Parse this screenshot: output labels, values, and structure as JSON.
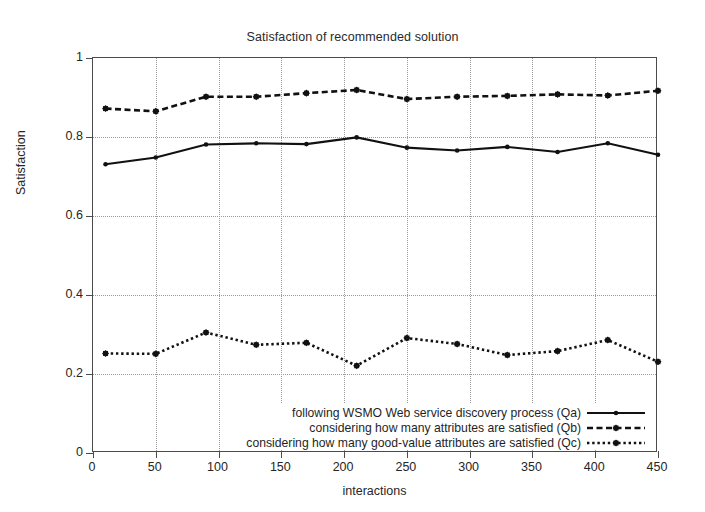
{
  "chart_data": {
    "type": "line",
    "title": "Satisfaction of recommended solution",
    "xlabel": "interactions",
    "ylabel": "Satisfaction",
    "xlim": [
      0,
      450
    ],
    "ylim": [
      0,
      1
    ],
    "xticks": [
      0,
      50,
      100,
      150,
      200,
      250,
      300,
      350,
      400,
      450
    ],
    "yticks": [
      0,
      0.2,
      0.4,
      0.6,
      0.8,
      1
    ],
    "grid": true,
    "legend_position": "bottom-right-inside",
    "x": [
      10,
      50,
      90,
      130,
      170,
      210,
      250,
      290,
      330,
      370,
      410,
      450
    ],
    "series": [
      {
        "name": "following WSMO Web service discovery process (Qa)",
        "key": "Qa",
        "linestyle": "solid",
        "color": "#111111",
        "values": [
          0.731,
          0.748,
          0.781,
          0.784,
          0.782,
          0.799,
          0.773,
          0.766,
          0.775,
          0.762,
          0.784,
          0.755
        ]
      },
      {
        "name": "considering how many attributes are satisfied (Qb)",
        "key": "Qb",
        "linestyle": "dashed",
        "color": "#111111",
        "values": [
          0.872,
          0.865,
          0.902,
          0.902,
          0.911,
          0.919,
          0.896,
          0.902,
          0.904,
          0.908,
          0.905,
          0.917
        ]
      },
      {
        "name": "considering how many good-value attributes are satisfied (Qc)",
        "key": "Qc",
        "linestyle": "dotted",
        "color": "#111111",
        "values": [
          0.252,
          0.251,
          0.305,
          0.274,
          0.279,
          0.221,
          0.291,
          0.276,
          0.248,
          0.258,
          0.286,
          0.231
        ]
      }
    ]
  },
  "axes": {
    "title": "Satisfaction of recommended solution",
    "x_label": "interactions",
    "y_label": "Satisfaction",
    "x_tick_labels": [
      "0",
      "50",
      "100",
      "150",
      "200",
      "250",
      "300",
      "350",
      "400",
      "450"
    ],
    "y_tick_labels": [
      "0",
      "0.2",
      "0.4",
      "0.6",
      "0.8",
      "1"
    ]
  },
  "legend": {
    "items": [
      {
        "label": "following WSMO Web service discovery process (Qa)",
        "style": "solid"
      },
      {
        "label": "considering how many attributes are satisfied (Qb)",
        "style": "dashed"
      },
      {
        "label": "considering how many good-value attributes are satisfied (Qc)",
        "style": "dotted"
      }
    ]
  }
}
